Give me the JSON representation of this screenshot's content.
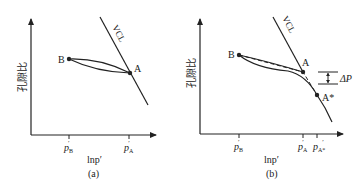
{
  "panels": [
    {
      "id": "a",
      "caption": "(a)",
      "y_axis_label": "孔隙比",
      "x_axis_label": "lnp′",
      "line_label": "VCL",
      "points": {
        "B": "B",
        "A": "A"
      },
      "x_ticks": [
        {
          "base": "p",
          "sub": "B",
          "prime": "′"
        },
        {
          "base": "p",
          "sub": "A",
          "prime": "′"
        }
      ]
    },
    {
      "id": "b",
      "caption": "(b)",
      "y_axis_label": "孔隙比",
      "x_axis_label": "lnp′",
      "line_label": "VCL",
      "points": {
        "B": "B",
        "A": "A",
        "A_star": "A*"
      },
      "delta_label": "ΔP",
      "x_ticks": [
        {
          "base": "p",
          "sub": "B",
          "prime": "′"
        },
        {
          "base": "p",
          "sub": "A",
          "prime": "′"
        },
        {
          "base": "p",
          "sub": "A*",
          "prime": "′"
        }
      ]
    }
  ],
  "colors": {
    "ink": "#222222",
    "background": "#ffffff"
  }
}
